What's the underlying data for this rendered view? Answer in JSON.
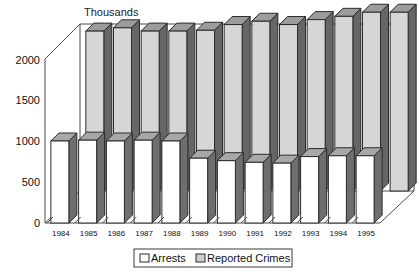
{
  "chart_data": {
    "type": "bar",
    "title": "Thousands",
    "subtitle": "",
    "xlabel": "",
    "ylabel": "Thousands",
    "ylim": [
      0,
      2000
    ],
    "yticks": [
      0,
      500,
      1000,
      1500,
      2000
    ],
    "grid": false,
    "legend_position": "bottom",
    "three_d": true,
    "categories": [
      "1984",
      "1985",
      "1986",
      "1987",
      "1988",
      "1989",
      "1990",
      "1991",
      "1992",
      "1993",
      "1994",
      "1995"
    ],
    "series": [
      {
        "name": "Arrests",
        "color": "#ffffff",
        "values": [
          1000,
          1010,
          1000,
          1010,
          1000,
          790,
          760,
          740,
          730,
          810,
          820,
          820
        ]
      },
      {
        "name": "Reported Crimes",
        "color": "#d6d6d6",
        "values": [
          1950,
          1990,
          1950,
          1950,
          1960,
          2030,
          2070,
          2030,
          2090,
          2130,
          2180,
          2180
        ]
      }
    ]
  },
  "axis": {
    "tick_labels": [
      "2000",
      "1500",
      "1000",
      "500",
      "0"
    ],
    "unit_title": "Thousands"
  },
  "legend": {
    "items": [
      {
        "label": "Arrests",
        "swatch": "white-swatch-icon"
      },
      {
        "label": "Reported Crimes",
        "swatch": "gray-swatch-icon"
      }
    ]
  }
}
